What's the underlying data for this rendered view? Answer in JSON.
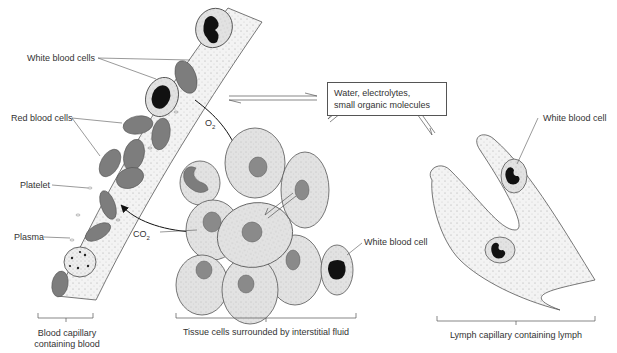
{
  "diagram": {
    "labels": {
      "white_blood_cells": "White blood cells",
      "red_blood_cells": "Red blood cells",
      "platelet": "Platelet",
      "plasma": "Plasma",
      "o2": "O",
      "o2_sub": "2",
      "co2": "CO",
      "co2_sub": "2",
      "white_blood_cell_tissue": "White blood cell",
      "white_blood_cell_lymph": "White blood cell"
    },
    "exchange_box": {
      "line1": "Water, electrolytes,",
      "line2": "small organic molecules"
    },
    "captions": {
      "blood_capillary_line1": "Blood capillary",
      "blood_capillary_line2": "containing blood",
      "tissue": "Tissue cells surrounded by interstitial fluid",
      "lymph": "Lymph capillary  containing lymph"
    },
    "colors": {
      "cell_fill": "#e3e3e3",
      "rbc_fill": "#7d7d7d",
      "nucleus_fill": "#8a8a8a",
      "wbc_nucleus": "#111111",
      "outline": "#555555"
    }
  }
}
